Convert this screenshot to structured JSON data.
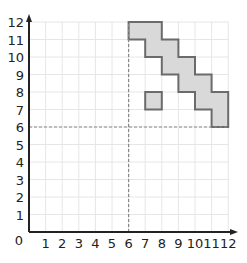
{
  "diagram": {
    "type": "coordinate-grid",
    "x_axis": {
      "min": 0,
      "max": 12,
      "ticks": [
        "1",
        "2",
        "3",
        "4",
        "5",
        "6",
        "7",
        "8",
        "9",
        "10",
        "11",
        "12"
      ]
    },
    "y_axis": {
      "min": 0,
      "max": 12,
      "ticks": [
        "1",
        "2",
        "3",
        "4",
        "5",
        "6",
        "7",
        "8",
        "9",
        "10",
        "11",
        "12"
      ]
    },
    "origin_label": "0",
    "dashed_lines": {
      "x": 6,
      "y": 6
    },
    "shapes": [
      {
        "name": "staircase-shape",
        "points": [
          [
            6,
            12
          ],
          [
            8,
            12
          ],
          [
            8,
            11
          ],
          [
            9,
            11
          ],
          [
            9,
            10
          ],
          [
            10,
            10
          ],
          [
            10,
            9
          ],
          [
            11,
            9
          ],
          [
            11,
            8
          ],
          [
            12,
            8
          ],
          [
            12,
            6
          ],
          [
            11,
            6
          ],
          [
            11,
            7
          ],
          [
            10,
            7
          ],
          [
            10,
            8
          ],
          [
            9,
            8
          ],
          [
            9,
            9
          ],
          [
            8,
            9
          ],
          [
            8,
            10
          ],
          [
            7,
            10
          ],
          [
            7,
            11
          ],
          [
            6,
            11
          ]
        ]
      },
      {
        "name": "small-square",
        "points": [
          [
            7,
            7
          ],
          [
            8,
            7
          ],
          [
            8,
            8
          ],
          [
            7,
            8
          ]
        ]
      }
    ],
    "colors": {
      "fill": "#d9d9d9",
      "stroke": "#6b6b6b",
      "grid": "#e6e6e6",
      "axis": "#222222",
      "dashed": "#888888"
    }
  }
}
